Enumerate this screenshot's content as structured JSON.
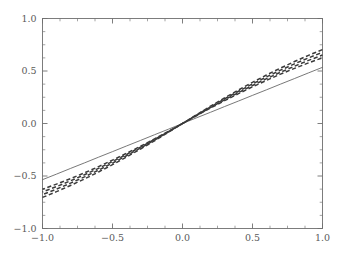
{
  "chart_data": {
    "type": "line",
    "title": "",
    "subtitle": "",
    "xlabel": "",
    "ylabel": "",
    "xlim": [
      -1.0,
      1.0
    ],
    "ylim": [
      -1.0,
      1.0
    ],
    "grid": false,
    "legend": "none",
    "x_major_ticks": [
      -1.0,
      -0.5,
      0.0,
      0.5,
      1.0
    ],
    "y_major_ticks": [
      -1.0,
      -0.5,
      0.0,
      0.5,
      1.0
    ],
    "x_tick_labels": [
      "−1.0",
      "−0.5",
      "0.0",
      "0.5",
      "1.0"
    ],
    "y_tick_labels": [
      "−1.0",
      "−0.5",
      "0.0",
      "0.5",
      "1.0"
    ],
    "x_minor_step": 0.125,
    "y_minor_step": 0.125,
    "tick_direction": "in",
    "axis_color": "#6f6f6f",
    "background_color": "#ffffff",
    "x": [
      -1.0,
      -0.9,
      -0.8,
      -0.7,
      -0.6,
      -0.5,
      -0.4,
      -0.3,
      -0.2,
      -0.1,
      0.0,
      0.1,
      0.2,
      0.3,
      0.4,
      0.5,
      0.6,
      0.7,
      0.8,
      0.9,
      1.0
    ],
    "series": [
      {
        "name": "solid-reference",
        "style": "solid",
        "color": "#555555",
        "width": 0.8,
        "dash": "",
        "values": [
          -0.535,
          -0.482,
          -0.428,
          -0.375,
          -0.321,
          -0.268,
          -0.214,
          -0.161,
          -0.107,
          -0.054,
          0.0,
          0.054,
          0.107,
          0.161,
          0.214,
          0.268,
          0.321,
          0.375,
          0.428,
          0.482,
          0.535
        ]
      },
      {
        "name": "dashed-curve-1",
        "style": "dashed",
        "color": "#3a3a3a",
        "width": 1.5,
        "dash": "4.2 2.6",
        "values": [
          -0.626,
          -0.577,
          -0.525,
          -0.47,
          -0.411,
          -0.349,
          -0.284,
          -0.217,
          -0.147,
          -0.074,
          0.0,
          0.074,
          0.147,
          0.217,
          0.284,
          0.349,
          0.411,
          0.47,
          0.525,
          0.577,
          0.626
        ]
      },
      {
        "name": "dashed-curve-2",
        "style": "dashed",
        "color": "#3a3a3a",
        "width": 1.5,
        "dash": "4.2 2.6",
        "values": [
          -0.652,
          -0.601,
          -0.546,
          -0.488,
          -0.427,
          -0.362,
          -0.295,
          -0.225,
          -0.152,
          -0.077,
          0.0,
          0.077,
          0.152,
          0.225,
          0.295,
          0.362,
          0.427,
          0.488,
          0.546,
          0.601,
          0.652
        ]
      },
      {
        "name": "dashed-curve-3",
        "style": "dashed",
        "color": "#3a3a3a",
        "width": 1.5,
        "dash": "4.2 2.6",
        "values": [
          -0.678,
          -0.625,
          -0.568,
          -0.508,
          -0.444,
          -0.377,
          -0.307,
          -0.234,
          -0.158,
          -0.08,
          0.0,
          0.08,
          0.158,
          0.234,
          0.307,
          0.377,
          0.444,
          0.508,
          0.568,
          0.625,
          0.678
        ]
      },
      {
        "name": "dashed-curve-4",
        "style": "dashed",
        "color": "#3a3a3a",
        "width": 1.5,
        "dash": "4.2 2.6",
        "values": [
          -0.704,
          -0.649,
          -0.59,
          -0.528,
          -0.462,
          -0.392,
          -0.319,
          -0.243,
          -0.165,
          -0.083,
          0.0,
          0.083,
          0.165,
          0.243,
          0.319,
          0.392,
          0.462,
          0.528,
          0.59,
          0.649,
          0.704
        ]
      }
    ]
  }
}
